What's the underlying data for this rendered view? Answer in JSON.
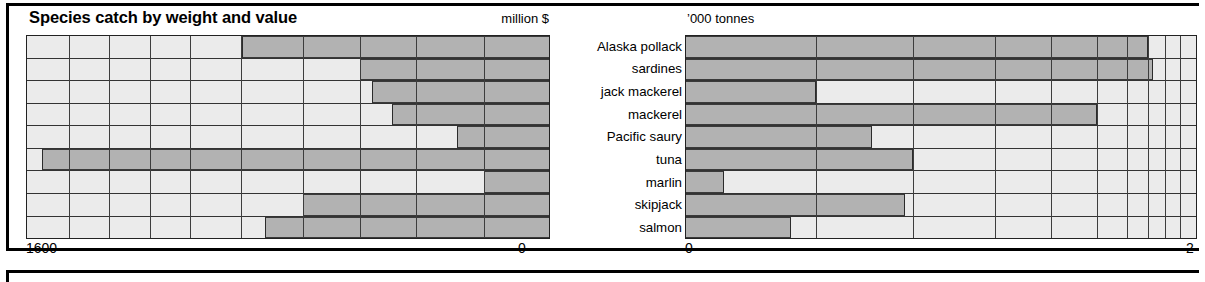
{
  "header": {
    "title": "Species catch by weight and value",
    "unit_left": "million  $",
    "unit_right": "’000 tonnes"
  },
  "categories": [
    "Alaska pollack",
    "sardines",
    "jack mackerel",
    "mackerel",
    "Pacific saury",
    "tuna",
    "marlin",
    "skipjack",
    "salmon"
  ],
  "axes": {
    "left_min_label": "1600",
    "left_max_label": "0",
    "right_min_label": "0",
    "right_max_label": "2"
  },
  "colors": {
    "bar_fill": "#b2b2b2",
    "plot_background": "#ebebeb",
    "grid": "#3d3d3d",
    "outline": "#000000"
  },
  "chart_data": [
    {
      "type": "bar",
      "id": "value-chart",
      "title": "Species catch by weight and value",
      "xlabel": "million $",
      "ylabel": "",
      "orientation": "horizontal-left",
      "note": "Value axis runs right-to-left: 0 at the right edge, 1600 at the left edge (logarithmic-like spacing). Bars are anchored at the 0 (right) end and extend leftwards.",
      "xlim": [
        0,
        1600
      ],
      "grid": true,
      "legend": null,
      "categories": [
        "Alaska pollack",
        "sardines",
        "jack mackerel",
        "mackerel",
        "Pacific saury",
        "tuna",
        "marlin",
        "skipjack",
        "salmon"
      ],
      "values": [
        820,
        480,
        440,
        370,
        210,
        1520,
        155,
        610,
        700
      ],
      "bar_start_fraction_from_left": [
        0.412,
        0.637,
        0.661,
        0.7,
        0.823,
        0.029,
        0.876,
        0.528,
        0.455
      ]
    },
    {
      "type": "bar",
      "id": "weight-chart",
      "title": "",
      "xlabel": "'000 tonnes",
      "ylabel": "",
      "orientation": "horizontal-right",
      "note": "Weight axis runs left-to-right: 0 at the left edge, 2 at the right edge (logarithmic-like spacing, ticks crowding towards 2). Bars are anchored at 0 (left) and extend rightwards.",
      "xlim": [
        0,
        2
      ],
      "grid": true,
      "legend": null,
      "categories": [
        "Alaska pollack",
        "sardines",
        "jack mackerel",
        "mackerel",
        "Pacific saury",
        "tuna",
        "marlin",
        "skipjack",
        "salmon"
      ],
      "values": [
        1.8,
        1.84,
        0.27,
        1.47,
        0.37,
        0.45,
        0.08,
        0.43,
        0.21
      ],
      "bar_end_fraction_from_left": [
        0.905,
        0.915,
        0.255,
        0.805,
        0.365,
        0.445,
        0.075,
        0.43,
        0.205
      ]
    }
  ]
}
